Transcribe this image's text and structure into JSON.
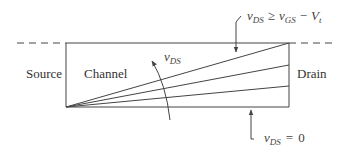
{
  "diagram": {
    "regions": {
      "source": "Source",
      "channel": "Channel",
      "drain": "Drain"
    },
    "annotations": {
      "sweep_label": {
        "var": "v",
        "sub": "DS"
      },
      "top_condition": {
        "lhs_var": "v",
        "lhs_sub": "DS",
        "op": "≥",
        "rhs_var": "v",
        "rhs_sub": "GS",
        "minus": "−",
        "vt_var": "V",
        "vt_sub": "t"
      },
      "bottom_condition": {
        "var": "v",
        "sub": "DS",
        "op": "=",
        "value": "0"
      }
    },
    "colors": {
      "stroke": "#444444",
      "text": "#333333"
    }
  }
}
